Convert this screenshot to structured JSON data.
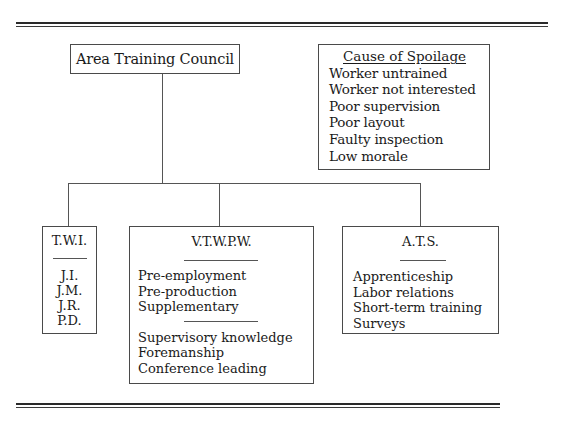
{
  "root": {
    "label": "Area Training Council"
  },
  "legend": {
    "title": "Cause of Spoilage",
    "items": [
      "Worker untrained",
      "Worker not interested",
      "Poor supervision",
      "Poor layout",
      "Faulty inspection",
      "Low morale"
    ]
  },
  "branches": [
    {
      "title": "T.W.I.",
      "groups": [
        [
          "J.I.",
          "J.M.",
          "J.R.",
          "P.D."
        ]
      ]
    },
    {
      "title": "V.T.W.P.W.",
      "groups": [
        [
          "Pre-employment",
          "Pre-production",
          "Supplementary"
        ],
        [
          "Supervisory knowledge",
          "Foremanship",
          "Conference leading"
        ]
      ]
    },
    {
      "title": "A.T.S.",
      "groups": [
        [
          "Apprenticeship",
          "Labor relations",
          "Short-term training",
          "Surveys"
        ]
      ]
    }
  ]
}
